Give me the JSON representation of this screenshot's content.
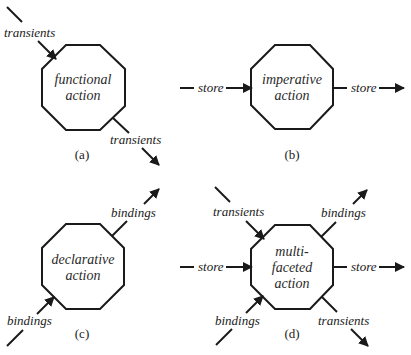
{
  "diagram": {
    "panels": [
      {
        "id": "a",
        "caption": "(a)",
        "node_lines": [
          "functional",
          "action"
        ],
        "flows": [
          {
            "direction": "in",
            "label": "transients",
            "from": "upper-left"
          },
          {
            "direction": "out",
            "label": "transients",
            "to": "lower-right"
          }
        ]
      },
      {
        "id": "b",
        "caption": "(b)",
        "node_lines": [
          "imperative",
          "action"
        ],
        "flows": [
          {
            "direction": "in",
            "label": "store",
            "from": "left"
          },
          {
            "direction": "out",
            "label": "store",
            "to": "right"
          }
        ]
      },
      {
        "id": "c",
        "caption": "(c)",
        "node_lines": [
          "declarative",
          "action"
        ],
        "flows": [
          {
            "direction": "in",
            "label": "bindings",
            "from": "lower-left"
          },
          {
            "direction": "out",
            "label": "bindings",
            "to": "upper-right"
          }
        ]
      },
      {
        "id": "d",
        "caption": "(d)",
        "node_lines": [
          "multi-",
          "faceted",
          "action"
        ],
        "flows": [
          {
            "direction": "in",
            "label": "transients",
            "from": "upper-left"
          },
          {
            "direction": "in",
            "label": "store",
            "from": "left"
          },
          {
            "direction": "in",
            "label": "bindings",
            "from": "lower-left"
          },
          {
            "direction": "out",
            "label": "bindings",
            "to": "upper-right"
          },
          {
            "direction": "out",
            "label": "store",
            "to": "right"
          },
          {
            "direction": "out",
            "label": "transients",
            "to": "lower-right"
          }
        ]
      }
    ],
    "colors": {
      "stroke": "#1a1a1a",
      "background": "#ffffff"
    }
  }
}
